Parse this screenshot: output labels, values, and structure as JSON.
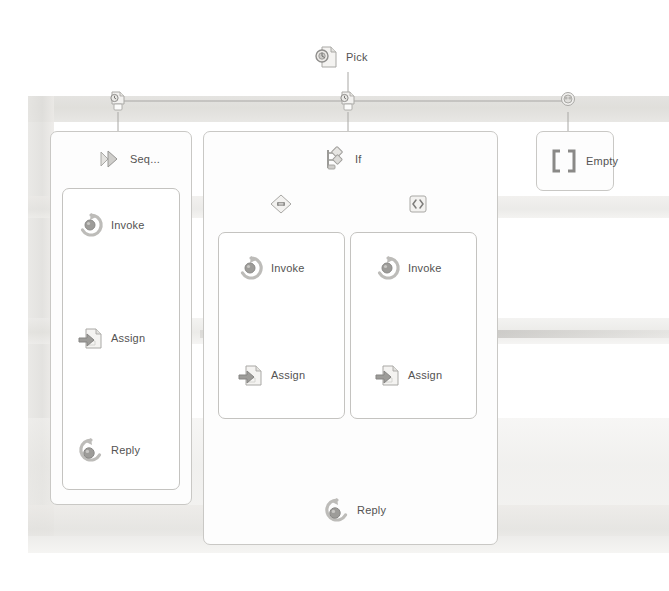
{
  "diagram": {
    "type": "workflow-designer",
    "root": {
      "label": "Pick",
      "icon": "pick-icon"
    },
    "branches": [
      {
        "id": "branch-1",
        "trigger_icon": "pick-branch-trigger-icon",
        "body": {
          "label": "Seq...",
          "icon": "sequence-icon",
          "children": [
            {
              "label": "Invoke",
              "icon": "invoke-icon"
            },
            {
              "label": "Assign",
              "icon": "assign-icon"
            },
            {
              "label": "Reply",
              "icon": "reply-icon"
            }
          ]
        }
      },
      {
        "id": "branch-2",
        "trigger_icon": "pick-branch-trigger-icon",
        "body": {
          "label": "If",
          "icon": "if-icon",
          "condition_true_icon": "decision-diamond-icon",
          "condition_false_icon": "decision-square-icon",
          "then_branch": [
            {
              "label": "Invoke",
              "icon": "invoke-icon"
            },
            {
              "label": "Assign",
              "icon": "assign-icon"
            }
          ],
          "else_branch": [
            {
              "label": "Invoke",
              "icon": "invoke-icon"
            },
            {
              "label": "Assign",
              "icon": "assign-icon"
            }
          ],
          "merge": {
            "label": "Reply",
            "icon": "reply-icon"
          }
        }
      },
      {
        "id": "branch-3",
        "trigger_icon": "pick-branch-event-icon",
        "body": {
          "label": "Empty",
          "icon": "empty-brackets-icon"
        }
      }
    ]
  },
  "colors": {
    "line": "#a8a7a4",
    "box_border": "#c9c8c5",
    "label_text": "#545352",
    "icon_fill": "#b9b8b5",
    "icon_stroke": "#9a9997",
    "background": "#ffffff",
    "scan_band": "#e2e1de"
  },
  "labels": {
    "pick": "Pick",
    "seq": "Seq...",
    "if": "If",
    "empty": "Empty",
    "invoke": "Invoke",
    "assign": "Assign",
    "reply": "Reply"
  }
}
